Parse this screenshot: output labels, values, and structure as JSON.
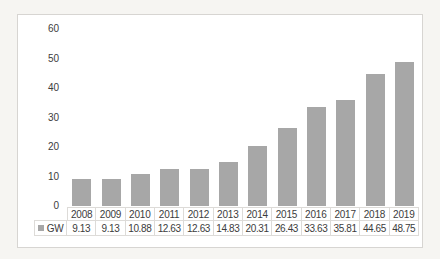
{
  "chart_data": {
    "type": "bar",
    "title": "",
    "xlabel": "",
    "ylabel": "",
    "categories": [
      "2008",
      "2009",
      "2010",
      "2011",
      "2012",
      "2013",
      "2014",
      "2015",
      "2016",
      "2017",
      "2018",
      "2019"
    ],
    "series": [
      {
        "name": "GW",
        "values": [
          9.13,
          9.13,
          10.88,
          12.63,
          12.63,
          14.83,
          20.31,
          26.43,
          33.63,
          35.81,
          44.65,
          48.75
        ]
      }
    ],
    "ylim": [
      0,
      60
    ],
    "y_ticks": [
      60,
      50,
      40,
      30,
      20,
      10,
      0
    ],
    "grid": false,
    "legend_position": "bottom-left",
    "data_table_shown": true
  },
  "legend": {
    "label": "GW"
  },
  "colors": {
    "bar": "#a7a7a7",
    "legend_swatch": "#a7a7a7",
    "frame_border": "#d7d5d2",
    "table_border": "#dddbd8",
    "text": "#3c3c3c",
    "chart_background": "#ffffff",
    "page_background": "#f6f5f2"
  }
}
